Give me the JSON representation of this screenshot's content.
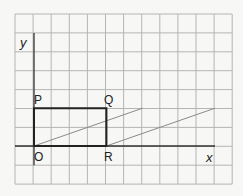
{
  "grid": {
    "left": 15,
    "top": 14,
    "cols": 12,
    "rows": 9,
    "cell_w": 18.1,
    "cell_h": 18.9,
    "color": "#b5b5b5"
  },
  "axes": {
    "origin_px": [
      34,
      146
    ],
    "x_axis_label": "x",
    "y_axis_label": "y",
    "color": "#333333"
  },
  "shape": {
    "name": "rectangle OPQR",
    "color": "#222222",
    "vertices": [
      {
        "label": "O",
        "coord": [
          0,
          0
        ]
      },
      {
        "label": "P",
        "coord": [
          0,
          2
        ]
      },
      {
        "label": "Q",
        "coord": [
          4,
          2
        ]
      },
      {
        "label": "R",
        "coord": [
          4,
          0
        ]
      }
    ]
  },
  "guide_lines": {
    "color": "#8a8a8a",
    "segments": [
      {
        "from": [
          0,
          0
        ],
        "to": [
          6,
          2
        ]
      },
      {
        "from": [
          4,
          0
        ],
        "to": [
          10,
          2
        ]
      }
    ]
  },
  "labels": {
    "O": "O",
    "P": "P",
    "Q": "Q",
    "R": "R",
    "x": "x",
    "y": "y"
  }
}
